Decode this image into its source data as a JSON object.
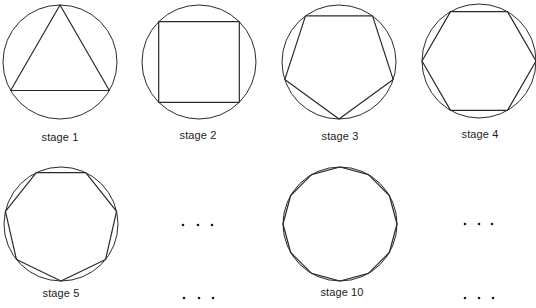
{
  "diagram": {
    "title": "",
    "stroke_color": "#2a2a2a",
    "stages": [
      {
        "label": "stage 1",
        "sides": 3,
        "cx": 60,
        "cy": 62,
        "r": 57,
        "rotation_deg": -90,
        "label_x": 60,
        "label_y": 131
      },
      {
        "label": "stage 2",
        "sides": 4,
        "cx": 199,
        "cy": 62,
        "r": 57,
        "rotation_deg": -135,
        "label_x": 198,
        "label_y": 129
      },
      {
        "label": "stage 3",
        "sides": 5,
        "cx": 339,
        "cy": 62,
        "r": 57,
        "rotation_deg": 90,
        "label_x": 340,
        "label_y": 130
      },
      {
        "label": "stage 4",
        "sides": 6,
        "cx": 479,
        "cy": 61,
        "r": 57,
        "rotation_deg": 0,
        "label_x": 480,
        "label_y": 128
      },
      {
        "label": "stage 5",
        "sides": 7,
        "cx": 61,
        "cy": 224,
        "r": 57,
        "rotation_deg": 90,
        "label_x": 61,
        "label_y": 287
      },
      {
        "label": "stage 10",
        "sides": 12,
        "cx": 340,
        "cy": 224,
        "r": 57,
        "rotation_deg": -90,
        "label_x": 342,
        "label_y": 286
      }
    ],
    "ellipses": [
      {
        "name": "ellipsis-middle-row2",
        "dots": [
          [
            183,
            225
          ],
          [
            198,
            225
          ],
          [
            212,
            225
          ]
        ]
      },
      {
        "name": "ellipsis-middle-row2-label",
        "dots": [
          [
            184,
            298
          ],
          [
            199,
            298
          ],
          [
            213,
            298
          ]
        ]
      },
      {
        "name": "ellipsis-right-row2",
        "dots": [
          [
            465,
            224
          ],
          [
            479,
            224
          ],
          [
            492,
            224
          ]
        ]
      },
      {
        "name": "ellipsis-right-row2-label",
        "dots": [
          [
            465,
            298
          ],
          [
            479,
            298
          ],
          [
            493,
            298
          ]
        ]
      }
    ]
  }
}
